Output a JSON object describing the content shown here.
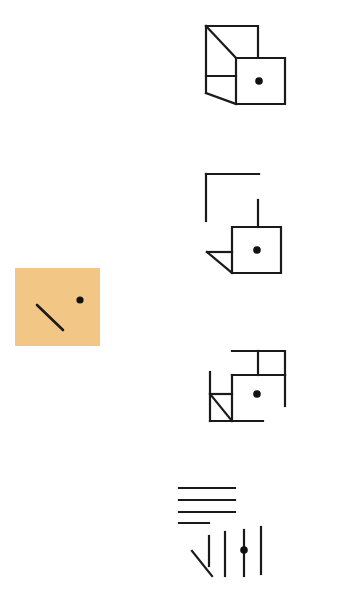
{
  "task": {
    "type": "visual-figure-matching",
    "canvas": {
      "width": 342,
      "height": 597,
      "background": "#ffffff"
    }
  },
  "reference": {
    "name": "reference-panel",
    "fill_color": "#f2c786",
    "x": 15,
    "y": 268,
    "width": 85,
    "height": 78,
    "contents": {
      "diagonal_line": {
        "x1": 37,
        "y1": 305,
        "x2": 63,
        "y2": 330,
        "stroke": "#1a1a1a",
        "stroke_width": 2.6
      },
      "dot": {
        "cx": 80,
        "cy": 300,
        "r": 3.6,
        "fill": "#111111"
      }
    }
  },
  "ink": {
    "stroke": "#1a1a1a",
    "dot_fill": "#111111",
    "stroke_width": 2.2
  },
  "options": [
    {
      "id": "option-1",
      "name": "option-cube-open-box",
      "label": "Open box / cube outline with dot",
      "bbox": {
        "x": 203,
        "y": 22,
        "width": 86,
        "height": 86
      },
      "dot": {
        "cx": 259,
        "cy": 81,
        "r": 3.8
      },
      "polylines": [
        [
          [
            206,
            26
          ],
          [
            258,
            26
          ],
          [
            258,
            58
          ]
        ],
        [
          [
            206,
            26
          ],
          [
            206,
            93
          ]
        ],
        [
          [
            206,
            26
          ],
          [
            236,
            58
          ]
        ],
        [
          [
            206,
            76
          ],
          [
            236,
            76
          ]
        ],
        [
          [
            206,
            93
          ],
          [
            236,
            104
          ]
        ],
        [
          [
            236,
            58
          ],
          [
            285,
            58
          ],
          [
            285,
            104
          ],
          [
            236,
            104
          ],
          [
            236,
            58
          ]
        ]
      ]
    },
    {
      "id": "option-2",
      "name": "option-bracket-square-triangle",
      "label": "Bracket, square with dot and left triangle flap",
      "bbox": {
        "x": 203,
        "y": 170,
        "width": 86,
        "height": 106
      },
      "dot": {
        "cx": 257,
        "cy": 250,
        "r": 3.8
      },
      "polylines": [
        [
          [
            206,
            174
          ],
          [
            259,
            174
          ]
        ],
        [
          [
            206,
            174
          ],
          [
            206,
            221
          ]
        ],
        [
          [
            258,
            200
          ],
          [
            258,
            227
          ]
        ],
        [
          [
            232,
            227
          ],
          [
            281,
            227
          ],
          [
            281,
            273
          ],
          [
            232,
            273
          ],
          [
            232,
            227
          ]
        ],
        [
          [
            207,
            252
          ],
          [
            232,
            252
          ]
        ],
        [
          [
            207,
            252
          ],
          [
            232,
            273
          ]
        ]
      ]
    },
    {
      "id": "option-3",
      "name": "option-stepped-square-triangle",
      "label": "Stepped outline with square, dot and small hatched triangle",
      "bbox": {
        "x": 203,
        "y": 348,
        "width": 90,
        "height": 80
      },
      "dot": {
        "cx": 257,
        "cy": 394,
        "r": 3.8
      },
      "polylines": [
        [
          [
            232,
            351
          ],
          [
            285,
            351
          ],
          [
            285,
            375
          ]
        ],
        [
          [
            258,
            351
          ],
          [
            258,
            375
          ]
        ],
        [
          [
            232,
            375
          ],
          [
            285,
            375
          ]
        ],
        [
          [
            285,
            375
          ],
          [
            285,
            406
          ]
        ],
        [
          [
            210,
            372
          ],
          [
            210,
            421
          ]
        ],
        [
          [
            232,
            375
          ],
          [
            232,
            421
          ]
        ],
        [
          [
            210,
            394
          ],
          [
            232,
            394
          ]
        ],
        [
          [
            210,
            394
          ],
          [
            232,
            421
          ]
        ],
        [
          [
            210,
            421
          ],
          [
            263,
            421
          ]
        ]
      ]
    },
    {
      "id": "option-4",
      "name": "option-disassembled-strokes",
      "label": "Disassembled parallel strokes with dot",
      "bbox": {
        "x": 176,
        "y": 483,
        "width": 90,
        "height": 93
      },
      "dot": {
        "cx": 244,
        "cy": 550,
        "r": 3.8
      },
      "polylines": [
        [
          [
            179,
            488
          ],
          [
            235,
            488
          ]
        ],
        [
          [
            179,
            500
          ],
          [
            235,
            500
          ]
        ],
        [
          [
            179,
            512
          ],
          [
            235,
            512
          ]
        ],
        [
          [
            179,
            523
          ],
          [
            209,
            523
          ]
        ],
        [
          [
            225,
            532
          ],
          [
            225,
            576
          ]
        ],
        [
          [
            244,
            530
          ],
          [
            244,
            576
          ]
        ],
        [
          [
            261,
            527
          ],
          [
            261,
            574
          ]
        ],
        [
          [
            209,
            536
          ],
          [
            209,
            566
          ]
        ],
        [
          [
            192,
            551
          ],
          [
            212,
            576
          ]
        ]
      ]
    }
  ]
}
